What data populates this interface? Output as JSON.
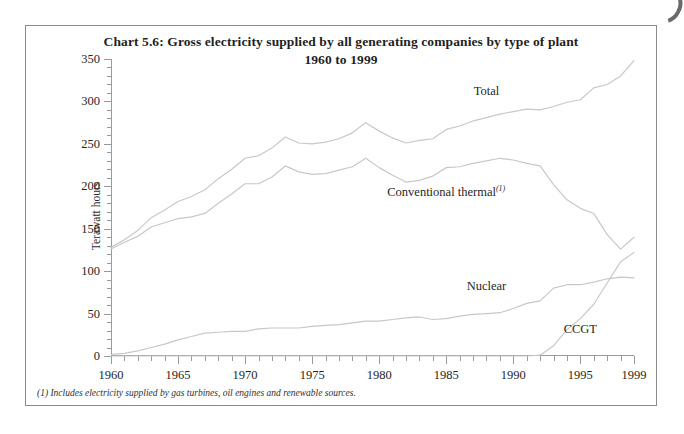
{
  "figure": {
    "title_line1": "Chart 5.6:  Gross electricity supplied by all generating companies by type of plant",
    "title_line2": "1960 to 1999",
    "footnote": "(1) Includes electricity supplied by gas turbines, oil engines and renewable sources.",
    "frame_color": "#8b8b8b",
    "line_color": "#c8c8c8",
    "axis_color": "#9a9a9a"
  },
  "labels": {
    "total": "Total",
    "conventional_thermal": "Conventional thermal",
    "conventional_thermal_footnote_marker": "(1)",
    "nuclear": "Nuclear",
    "ccgt": "CCGT"
  },
  "chart_data": {
    "type": "line",
    "title": "Chart 5.6:  Gross electricity supplied by all generating companies by type of plant 1960 to 1999",
    "subtitle": "1960 to 1999",
    "xlabel": "",
    "ylabel": "Terawatt hours",
    "xlim": [
      1960,
      1999
    ],
    "ylim": [
      0,
      350
    ],
    "yticks": [
      0,
      50,
      100,
      150,
      200,
      250,
      300,
      350
    ],
    "ytick_labels": [
      "0",
      "50",
      "100",
      "150",
      "200",
      "250",
      "300",
      "350"
    ],
    "y_minor_step": 10,
    "xticks": [
      1960,
      1965,
      1970,
      1975,
      1980,
      1985,
      1990,
      1995,
      1999
    ],
    "xtick_labels": [
      "1960",
      "1965",
      "1970",
      "1975",
      "1980",
      "1985",
      "1990",
      "1995",
      "1999"
    ],
    "x_minor_step": 1,
    "grid": false,
    "legend_position": "inline-annotations",
    "x": [
      1960,
      1961,
      1962,
      1963,
      1964,
      1965,
      1966,
      1967,
      1968,
      1969,
      1970,
      1971,
      1972,
      1973,
      1974,
      1975,
      1976,
      1977,
      1978,
      1979,
      1980,
      1981,
      1982,
      1983,
      1984,
      1985,
      1986,
      1987,
      1988,
      1989,
      1990,
      1991,
      1992,
      1993,
      1994,
      1995,
      1996,
      1997,
      1998,
      1999
    ],
    "series": [
      {
        "name": "Total",
        "values": [
          128,
          137,
          148,
          163,
          172,
          182,
          188,
          196,
          209,
          220,
          233,
          236,
          245,
          258,
          251,
          250,
          252,
          256,
          263,
          275,
          265,
          257,
          251,
          254,
          256,
          267,
          271,
          277,
          281,
          285,
          288,
          291,
          290,
          294,
          299,
          302,
          316,
          320,
          330,
          348
        ]
      },
      {
        "name": "Conventional thermal",
        "values": [
          126,
          134,
          141,
          152,
          157,
          162,
          164,
          168,
          180,
          191,
          203,
          203,
          211,
          224,
          217,
          214,
          215,
          219,
          223,
          233,
          222,
          213,
          205,
          207,
          212,
          222,
          223,
          227,
          230,
          233,
          231,
          227,
          224,
          202,
          184,
          174,
          168,
          143,
          126,
          140
        ]
      },
      {
        "name": "Nuclear",
        "values": [
          2,
          3,
          6,
          10,
          14,
          19,
          23,
          27,
          28,
          29,
          29,
          32,
          33,
          33,
          33,
          35,
          36,
          37,
          39,
          41,
          41,
          43,
          45,
          46,
          43,
          44,
          47,
          49,
          50,
          51,
          56,
          62,
          65,
          80,
          84,
          84,
          87,
          91,
          93,
          92
        ]
      },
      {
        "name": "CCGT",
        "values": [
          0,
          0,
          0,
          0,
          0,
          0,
          0,
          0,
          0,
          0,
          0,
          0,
          0,
          0,
          0,
          0,
          0,
          0,
          0,
          0,
          0,
          0,
          0,
          0,
          0,
          0,
          0,
          0,
          0,
          0,
          0,
          0,
          1,
          12,
          31,
          44,
          61,
          86,
          111,
          122
        ]
      }
    ],
    "annotations": [
      {
        "text": "Total",
        "x": 1988,
        "y": 312
      },
      {
        "text": "Conventional thermal",
        "x": 1985,
        "y": 193
      },
      {
        "text": "Nuclear",
        "x": 1988,
        "y": 82
      },
      {
        "text": "CCGT",
        "x": 1995,
        "y": 32
      }
    ]
  }
}
